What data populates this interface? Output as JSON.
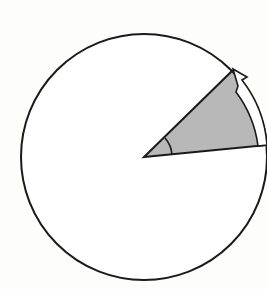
{
  "diagram": {
    "title": "",
    "colors": {
      "background": "#fdfdfb",
      "stroke": "#1a1a1a",
      "sector_fill": "#b8b8b8",
      "arrow_fill": "#ffffff"
    },
    "sector_angle_deg": 40
  }
}
